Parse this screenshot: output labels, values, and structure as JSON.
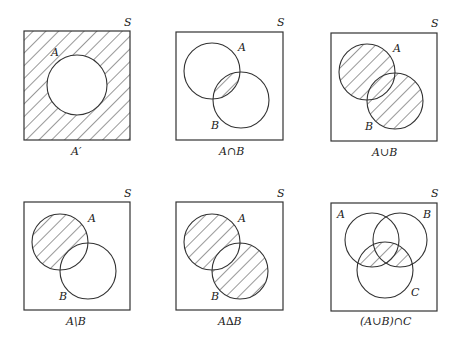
{
  "universal_label": "S",
  "colors": {
    "ink": "#333333",
    "background": "#ffffff"
  },
  "diagrams": [
    {
      "caption": "A′",
      "labels": {
        "A": "A"
      },
      "shaded": "complement of A"
    },
    {
      "caption": "A∩B",
      "labels": {
        "A": "A",
        "B": "B"
      },
      "shaded": "intersection"
    },
    {
      "caption": "A∪B",
      "labels": {
        "A": "A",
        "B": "B"
      },
      "shaded": "union"
    },
    {
      "caption": "A\\B",
      "labels": {
        "A": "A",
        "B": "B"
      },
      "shaded": "difference"
    },
    {
      "caption": "A∆B",
      "labels": {
        "A": "A",
        "B": "B"
      },
      "shaded": "symmetric difference"
    },
    {
      "caption": "(A∪B)∩C",
      "labels": {
        "A": "A",
        "B": "B",
        "C": "C"
      },
      "shaded": "union intersect C"
    }
  ]
}
